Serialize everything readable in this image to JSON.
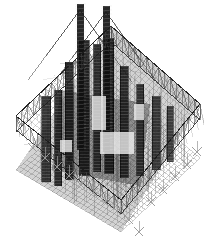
{
  "figure": {
    "kind": "architectural-rendering",
    "projection": "axonometric",
    "palette": {
      "background": "#ffffff",
      "frame_line": "#1b1b1b",
      "lattice_line": "#3a3a3a",
      "mesh_line": "#555555",
      "column_dark": "#101010",
      "column_mid": "#2a2a2a",
      "shadow_wash": "#6e6e6e",
      "foot_marker": "#9a9a9a",
      "highlight_gap": "#f2f2f2"
    },
    "canvas": {
      "width": 210,
      "height": 242
    },
    "plan_vertices": {
      "top": [
        111,
        26
      ],
      "left": [
        16,
        116
      ],
      "right": [
        200,
        104
      ],
      "bottom": [
        121,
        200
      ]
    },
    "deck_vertices": {
      "top": [
        111,
        84
      ],
      "left": [
        16,
        170
      ],
      "right": [
        200,
        158
      ],
      "bottom": [
        121,
        232
      ]
    },
    "masts": [
      {
        "name": "mast-left",
        "x": 80,
        "top_y": 4,
        "base_y": 150,
        "width": 7
      },
      {
        "name": "mast-right",
        "x": 106,
        "top_y": 6,
        "base_y": 152,
        "width": 7
      }
    ],
    "columns": [
      {
        "x": 46,
        "top_y": 96,
        "bottom_y": 182,
        "width": 9,
        "tone": "#1d1d1d"
      },
      {
        "x": 58,
        "top_y": 90,
        "bottom_y": 186,
        "width": 7,
        "tone": "#141414"
      },
      {
        "x": 69,
        "top_y": 62,
        "bottom_y": 180,
        "width": 8,
        "tone": "#0e0e0e"
      },
      {
        "x": 84,
        "top_y": 40,
        "bottom_y": 176,
        "width": 10,
        "tone": "#0b0b0b"
      },
      {
        "x": 97,
        "top_y": 44,
        "bottom_y": 172,
        "width": 7,
        "tone": "#171717"
      },
      {
        "x": 109,
        "top_y": 38,
        "bottom_y": 174,
        "width": 9,
        "tone": "#0c0c0c"
      },
      {
        "x": 124,
        "top_y": 66,
        "bottom_y": 178,
        "width": 8,
        "tone": "#151515"
      },
      {
        "x": 140,
        "top_y": 84,
        "bottom_y": 176,
        "width": 7,
        "tone": "#1c1c1c"
      },
      {
        "x": 156,
        "top_y": 96,
        "bottom_y": 170,
        "width": 8,
        "tone": "#222222"
      },
      {
        "x": 170,
        "top_y": 106,
        "bottom_y": 162,
        "width": 6,
        "tone": "#2a2a2a"
      }
    ],
    "truss_edges": [
      {
        "name": "edge-top-left",
        "from": [
          16,
          116
        ],
        "to": [
          111,
          26
        ],
        "bays": 16,
        "depth": 16
      },
      {
        "name": "edge-top-right",
        "from": [
          111,
          26
        ],
        "to": [
          200,
          104
        ],
        "bays": 15,
        "depth": 16
      },
      {
        "name": "edge-bottom-left",
        "from": [
          16,
          116
        ],
        "to": [
          121,
          200
        ],
        "bays": 15,
        "depth": 14
      },
      {
        "name": "edge-bottom-right",
        "from": [
          121,
          200
        ],
        "to": [
          200,
          104
        ],
        "bays": 14,
        "depth": 14
      }
    ],
    "support_feet": {
      "marker": "x-cross",
      "size": 9,
      "color": "#9a9a9a",
      "positions": [
        [
          33,
          148
        ],
        [
          45,
          158
        ],
        [
          57,
          167
        ],
        [
          69,
          176
        ],
        [
          81,
          185
        ],
        [
          93,
          193
        ],
        [
          105,
          202
        ],
        [
          117,
          211
        ],
        [
          129,
          220
        ],
        [
          139,
          232
        ],
        [
          151,
          202
        ],
        [
          163,
          190
        ],
        [
          175,
          177
        ],
        [
          187,
          165
        ],
        [
          197,
          152
        ]
      ]
    },
    "highlight_patches": [
      {
        "x": 92,
        "y": 96,
        "w": 14,
        "h": 34
      },
      {
        "x": 100,
        "y": 132,
        "w": 34,
        "h": 22
      },
      {
        "x": 134,
        "y": 104,
        "w": 10,
        "h": 16
      },
      {
        "x": 60,
        "y": 140,
        "w": 12,
        "h": 12
      }
    ],
    "labels": {
      "title": "",
      "caption": "",
      "annotations": []
    }
  }
}
